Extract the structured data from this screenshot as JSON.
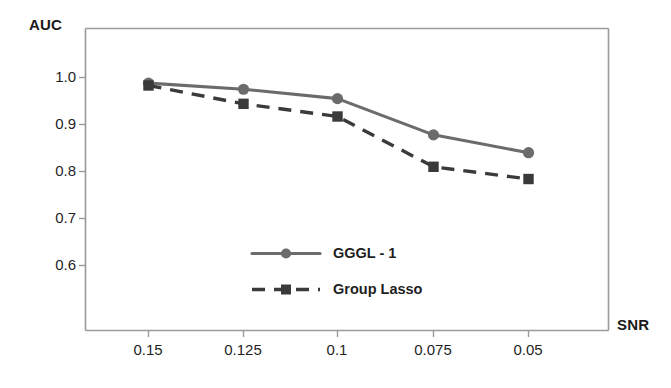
{
  "chart_data": {
    "type": "line",
    "title": "",
    "subtitle": "",
    "xlabel": "SNR",
    "ylabel": "AUC",
    "categories": [
      "0.15",
      "0.125",
      "0.1",
      "0.075",
      "0.05"
    ],
    "x": [
      0.15,
      0.125,
      0.1,
      0.075,
      0.05
    ],
    "xtick_labels": [
      "0.15",
      "0.125",
      "0.1",
      "0.075",
      "0.05"
    ],
    "ytick_labels": [
      "1.0",
      "0.9",
      "0.8",
      "0.7",
      "0.6"
    ],
    "yticks": [
      1.0,
      0.9,
      0.8,
      0.7,
      0.6
    ],
    "ylim": [
      0.555,
      1.035
    ],
    "grid": false,
    "legend_position": "center",
    "series": [
      {
        "name": "GGGL - 1",
        "values": [
          0.988,
          0.975,
          0.955,
          0.878,
          0.84
        ],
        "color": "#6b6b6b",
        "linestyle": "solid",
        "marker": "circle"
      },
      {
        "name": "Group Lasso",
        "values": [
          0.983,
          0.944,
          0.917,
          0.81,
          0.784
        ],
        "color": "#3a3a3a",
        "linestyle": "dashed",
        "marker": "square"
      }
    ]
  },
  "axes": {
    "y_title": "AUC",
    "x_title": "SNR",
    "frame_color": "#9a9a9a"
  },
  "legend": {
    "items": [
      {
        "label": "GGGL - 1"
      },
      {
        "label": "Group Lasso"
      }
    ]
  }
}
